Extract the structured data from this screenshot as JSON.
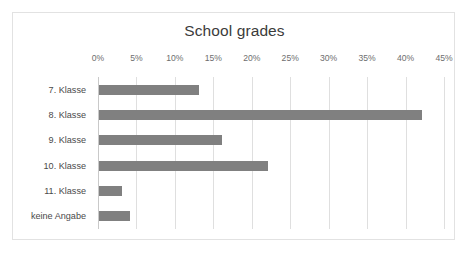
{
  "chart_data": {
    "type": "bar",
    "orientation": "horizontal",
    "title": "School grades",
    "xlabel": "",
    "ylabel": "",
    "categories": [
      "7. Klasse",
      "8. Klasse",
      "9. Klasse",
      "10. Klasse",
      "11. Klasse",
      "keine Angabe"
    ],
    "values": [
      13,
      42,
      16,
      22,
      3,
      4
    ],
    "value_suffix": "%",
    "xlim": [
      0,
      45
    ],
    "xticks": [
      0,
      5,
      10,
      15,
      20,
      25,
      30,
      35,
      40,
      45
    ],
    "xtick_labels": [
      "0%",
      "5%",
      "10%",
      "15%",
      "20%",
      "25%",
      "30%",
      "35%",
      "40%",
      "45%"
    ],
    "grid": true,
    "legend": false,
    "series": [
      {
        "name": "School grades",
        "values": [
          13,
          42,
          16,
          22,
          3,
          4
        ]
      }
    ],
    "colors": {
      "bar": "#808080",
      "gridline": "#dfdfdf",
      "axis": "#c9c9c9",
      "title_text": "#3b3b3b",
      "tick_text": "#6e6e6e",
      "category_text": "#4a4a4a",
      "frame_border": "#e2e2e2",
      "background": "#ffffff"
    }
  }
}
